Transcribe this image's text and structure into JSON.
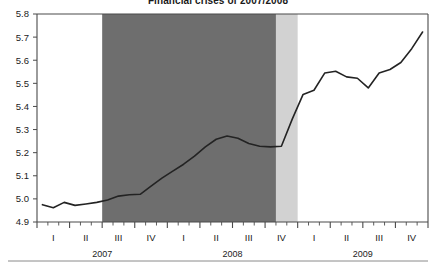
{
  "chart": {
    "title": "Financial crises of 2007/2008"
  },
  "chart_data": {
    "type": "line",
    "title": "Financial crises of 2007/2008",
    "xlabel": "",
    "ylabel": "",
    "ylim": [
      4.9,
      5.8
    ],
    "ytick_labels": [
      "4.9",
      "5.0",
      "5.1",
      "5.2",
      "5.3",
      "5.4",
      "5.5",
      "5.6",
      "5.7",
      "5.8"
    ],
    "ytick_values": [
      4.9,
      5.0,
      5.1,
      5.2,
      5.3,
      5.4,
      5.5,
      5.6,
      5.7,
      5.8
    ],
    "grid": false,
    "legend": "none",
    "quarter_labels": [
      "I",
      "II",
      "III",
      "IV",
      "I",
      "II",
      "III",
      "IV",
      "I",
      "II",
      "III",
      "IV"
    ],
    "year_labels": [
      "2007",
      "2008",
      "2009"
    ],
    "x": [
      "2007-01",
      "2007-02",
      "2007-03",
      "2007-04",
      "2007-05",
      "2007-06",
      "2007-07",
      "2007-08",
      "2007-09",
      "2007-10",
      "2007-11",
      "2007-12",
      "2008-01",
      "2008-02",
      "2008-03",
      "2008-04",
      "2008-05",
      "2008-06",
      "2008-07",
      "2008-08",
      "2008-09",
      "2008-10",
      "2008-11",
      "2008-12",
      "2009-01",
      "2009-02",
      "2009-03",
      "2009-04",
      "2009-05",
      "2009-06",
      "2009-07",
      "2009-08",
      "2009-09",
      "2009-10",
      "2009-11",
      "2009-12"
    ],
    "values": [
      4.975,
      4.962,
      4.985,
      4.972,
      4.978,
      4.985,
      4.995,
      5.012,
      5.018,
      5.02,
      5.055,
      5.09,
      5.12,
      5.15,
      5.185,
      5.225,
      5.258,
      5.272,
      5.262,
      5.24,
      5.228,
      5.225,
      5.228,
      5.345,
      5.452,
      5.47,
      5.545,
      5.552,
      5.528,
      5.522,
      5.48,
      5.545,
      5.56,
      5.59,
      5.65,
      5.722
    ],
    "series": [
      {
        "name": "index",
        "color": "#232323",
        "values": [
          4.975,
          4.962,
          4.985,
          4.972,
          4.978,
          4.985,
          4.995,
          5.012,
          5.018,
          5.02,
          5.055,
          5.09,
          5.12,
          5.15,
          5.185,
          5.225,
          5.258,
          5.272,
          5.262,
          5.24,
          5.228,
          5.225,
          5.228,
          5.345,
          5.452,
          5.47,
          5.545,
          5.552,
          5.528,
          5.522,
          5.48,
          5.545,
          5.56,
          5.59,
          5.65,
          5.722
        ]
      }
    ],
    "shaded_regions": [
      {
        "name": "crisis-dark-band",
        "label": "",
        "color": "#6e6e6e",
        "x_start": "2007-07",
        "x_end": "2008-11"
      },
      {
        "name": "crisis-light-band",
        "label": "",
        "color": "#d2d2d2",
        "x_start": "2008-11",
        "x_end": "2009-01"
      }
    ]
  },
  "colors": {
    "line": "#232323",
    "axis": "#4a4a4a",
    "dark_band": "#6e6e6e",
    "light_band": "#d2d2d2",
    "text": "#1c1c1c",
    "footer_rule": "#8a8a8a"
  }
}
